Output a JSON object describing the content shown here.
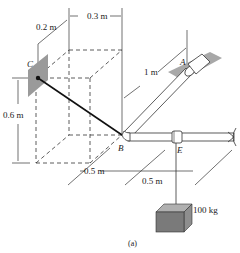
{
  "figure": {
    "caption": "(a)",
    "points": {
      "A": "A",
      "B": "B",
      "C": "C",
      "E": "E"
    },
    "dimensions": {
      "dim_0_3": "0.3 m",
      "dim_0_2": "0.2 m",
      "dim_1": "1 m",
      "dim_0_6": "0.6 m",
      "dim_0_5_left": "0.5 m",
      "dim_0_5_right": "0.5 m"
    },
    "mass_label": "100 kg",
    "colors": {
      "line": "#222222",
      "wall_plate": "#9a9a9a",
      "block_front": "#7a7a7a",
      "block_top": "#b0b0b0",
      "block_side": "#8e8e8e",
      "pipe": "#ffffff"
    }
  }
}
